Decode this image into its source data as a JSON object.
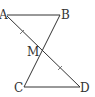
{
  "diagram": {
    "type": "geometry",
    "points": {
      "A": {
        "label": "A",
        "x": 5,
        "y": 15
      },
      "B": {
        "label": "B",
        "x": 60,
        "y": 15
      },
      "M": {
        "label": "M",
        "x": 42,
        "y": 50
      },
      "C": {
        "label": "C",
        "x": 24,
        "y": 87
      },
      "D": {
        "label": "D",
        "x": 80,
        "y": 87
      }
    },
    "segments": [
      {
        "from": "A",
        "to": "B"
      },
      {
        "from": "A",
        "to": "D"
      },
      {
        "from": "B",
        "to": "C"
      },
      {
        "from": "C",
        "to": "D"
      }
    ],
    "equal_marks": [
      {
        "segment": "AM",
        "ticks": 1
      },
      {
        "segment": "MD",
        "ticks": 1
      }
    ],
    "line_color": "#333333"
  }
}
